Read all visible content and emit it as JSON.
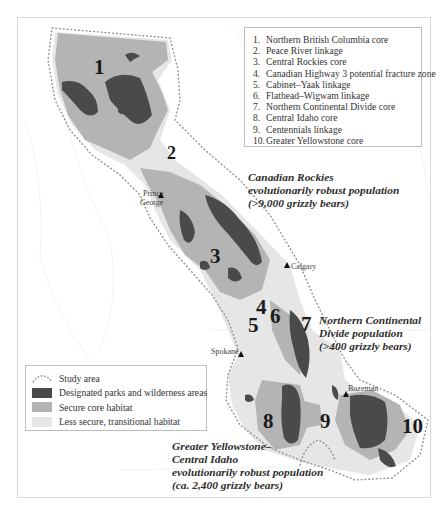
{
  "colors": {
    "parks": "#4a4a4a",
    "secure_core": "#b4b4b4",
    "transitional": "#e6e6e6",
    "study_area_dots": "#9a9a9a",
    "background": "#ffffff"
  },
  "corridor_legend": {
    "items": [
      {
        "num": "1.",
        "label": "Northern British Columbia core"
      },
      {
        "num": "2.",
        "label": "Peace River linkage"
      },
      {
        "num": "3.",
        "label": "Central Rockies core"
      },
      {
        "num": "4.",
        "label": "Canadian Highway 3 potential fracture zone"
      },
      {
        "num": "5.",
        "label": "Cabinet–Yaak linkage"
      },
      {
        "num": "6.",
        "label": "Flathead–Wigwam linkage"
      },
      {
        "num": "7.",
        "label": "Northern Continental Divide core"
      },
      {
        "num": "8.",
        "label": "Central Idaho core"
      },
      {
        "num": "9.",
        "label": "Centennials linkage"
      },
      {
        "num": "10.",
        "label": "Greater Yellowstone core"
      }
    ]
  },
  "region_numbers": [
    "1",
    "2",
    "3",
    "4",
    "5",
    "6",
    "7",
    "8",
    "9",
    "10"
  ],
  "population_labels": {
    "canadian_rockies": {
      "line1": "Canadian Rockies",
      "line2": "evolutionarily robust population",
      "line3": "(>9,000 grizzly bears)"
    },
    "northern_continental_divide": {
      "line1": "Northern Continental",
      "line2": "Divide population",
      "line3": "(>400 grizzly bears)"
    },
    "greater_yellowstone": {
      "line1": "Greater Yellowstone–",
      "line2": "Central Idaho",
      "line3": "evolutionarily robust population",
      "line4": "(ca. 2,400 grizzly bears)"
    }
  },
  "cities": {
    "prince_george_1": "Prince",
    "prince_george_2": "George",
    "calgary": "Calgary",
    "spokane": "Spokane",
    "bozeman": "Bozeman"
  },
  "habitat_key": {
    "items": [
      {
        "label": "Study area",
        "icon": "dotted-outline"
      },
      {
        "label": "Designated parks and wilderness areas",
        "icon": "dark-swatch"
      },
      {
        "label": "Secure core habitat",
        "icon": "medium-swatch"
      },
      {
        "label": "Less secure, transitional habitat",
        "icon": "light-swatch"
      }
    ]
  }
}
